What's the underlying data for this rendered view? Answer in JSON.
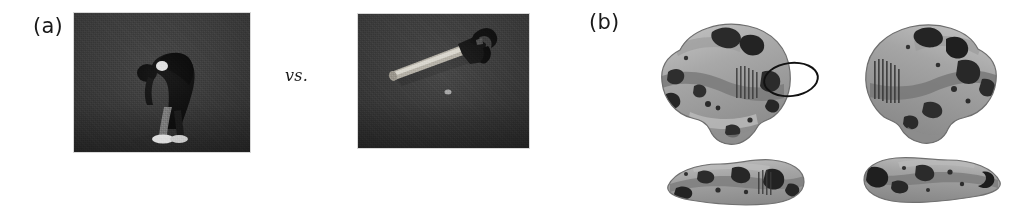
{
  "figure": {
    "panels": [
      {
        "letter": "(a)",
        "name": "stimulus-conditions",
        "stimuli": [
          {
            "name": "action-photo",
            "content": "person bending over, dark clothing, white sneakers, gray studio background"
          },
          {
            "name": "tool-photo",
            "content": "claw hammer lying on gray background, light handle, dark head"
          }
        ],
        "comparison_label": "vs."
      },
      {
        "letter": "(b)",
        "name": "brain-activation-maps",
        "views": [
          {
            "name": "left-hemisphere-lateral",
            "row": "top",
            "column": "left"
          },
          {
            "name": "right-hemisphere-lateral",
            "row": "top",
            "column": "right"
          },
          {
            "name": "left-hemisphere-ventral",
            "row": "bottom",
            "column": "left"
          },
          {
            "name": "right-hemisphere-ventral",
            "row": "bottom",
            "column": "right"
          }
        ],
        "annotations": [
          {
            "name": "activation-ellipse",
            "shape": "ellipse",
            "color": "#111111",
            "target_view": "left-hemisphere-lateral",
            "description": "black outlined ellipse marking posterior temporal activation cluster"
          }
        ]
      }
    ],
    "colors": {
      "background": "#ffffff",
      "photo_background": "#3b3b3b",
      "text": "#1a1a1a",
      "annotation": "#111111",
      "brain_light": "#c9c9c9",
      "brain_mid": "#8e8e8e",
      "brain_dark": "#3a3a3a"
    }
  }
}
